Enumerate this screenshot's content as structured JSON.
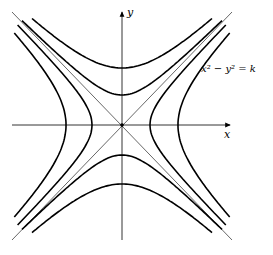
{
  "diagram": {
    "axes": {
      "x_label": "x",
      "y_label": "y"
    },
    "equation_label": "x² − y² = k",
    "origin_px": [
      122,
      125
    ],
    "curves": {
      "horizontal_opening_vertices_px": [
        -56,
        -30,
        28,
        56
      ],
      "vertical_opening_vertices_px": [
        -57,
        -30,
        30,
        59
      ],
      "asymptotes": [
        "y = x",
        "y = -x"
      ]
    },
    "colors": {
      "stroke": "#000000",
      "background": "#ffffff"
    }
  }
}
